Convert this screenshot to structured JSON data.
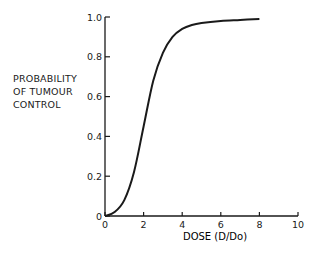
{
  "chart_data": {
    "type": "line",
    "title": "",
    "xlabel": "DOSE (D/Do)",
    "ylabel_lines": [
      "PROBABILITY",
      "OF TUMOUR",
      "CONTROL"
    ],
    "xlim": [
      0,
      10
    ],
    "ylim": [
      0,
      1.0
    ],
    "x_ticks": [
      "0",
      "2",
      "4",
      "6",
      "8",
      "10"
    ],
    "y_ticks": [
      "0",
      "0.2",
      "0.4",
      "0.6",
      "0.8",
      "1.0"
    ],
    "grid": false,
    "legend": null,
    "series": [
      {
        "name": "Tumour control probability",
        "x": [
          0,
          0.5,
          1.0,
          1.5,
          2.0,
          2.5,
          3.0,
          3.5,
          4.0,
          4.5,
          5.0,
          6.0,
          7.0,
          8.0
        ],
        "y": [
          0,
          0.02,
          0.08,
          0.22,
          0.45,
          0.68,
          0.82,
          0.9,
          0.94,
          0.96,
          0.97,
          0.98,
          0.985,
          0.99
        ]
      }
    ]
  }
}
